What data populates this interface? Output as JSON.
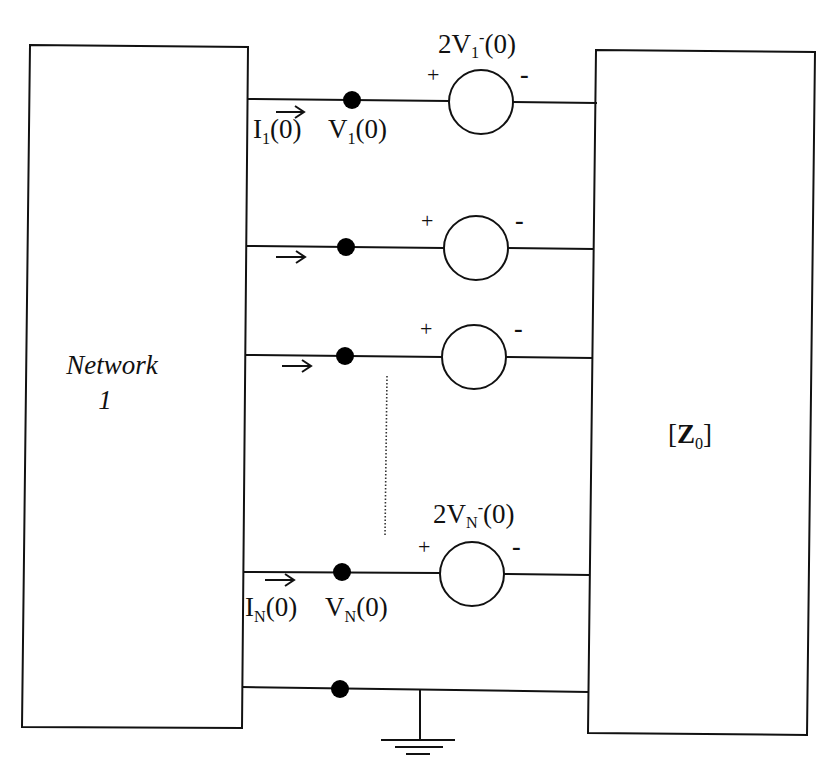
{
  "diagram": {
    "type": "circuit-schematic",
    "left_block": {
      "line1": "Network",
      "line2": "1"
    },
    "right_block": {
      "bracket_open": "[",
      "symbol": "Z",
      "subscript": "0",
      "bracket_close": "]"
    },
    "ports": [
      {
        "id": "port-1",
        "source_label": {
          "prefix": "2V",
          "sub": "1",
          "sup": "-",
          "suffix": "(0)"
        },
        "current_label": {
          "main": "I",
          "sub": "1",
          "suffix": "(0)"
        },
        "voltage_label": {
          "main": "V",
          "sub": "1",
          "suffix": "(0)"
        },
        "plus": "+",
        "minus": "-"
      },
      {
        "id": "port-2",
        "plus": "+",
        "minus": "-"
      },
      {
        "id": "port-3",
        "plus": "+",
        "minus": "-"
      },
      {
        "id": "port-N",
        "source_label": {
          "prefix": "2V",
          "sub": "N",
          "sup": "-",
          "suffix": "(0)"
        },
        "current_label": {
          "main": "I",
          "sub": "N",
          "suffix": "(0)"
        },
        "voltage_label": {
          "main": "V",
          "sub": "N",
          "suffix": "(0)"
        },
        "plus": "+",
        "minus": "-"
      }
    ],
    "ellipsis": "vertical-dotted-line",
    "ground": "ground-symbol"
  },
  "colors": {
    "line": "#111111",
    "background": "#ffffff"
  }
}
